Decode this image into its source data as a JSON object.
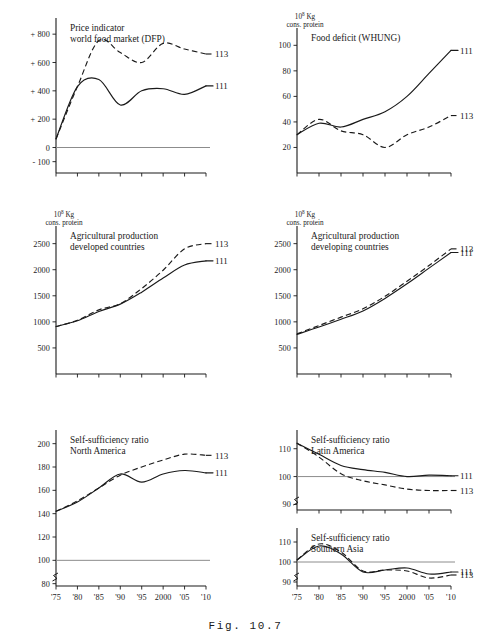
{
  "figure": {
    "caption": "Fig. 10.7"
  },
  "series_labels": {
    "a": "111",
    "b": "113"
  },
  "axis_units": {
    "base": "10",
    "exp": "8",
    "kg": " Kg",
    "protein": "cons. protein"
  },
  "charts": [
    {
      "id": "price-indicator",
      "title_line1": "Price indicator",
      "title_line2": "world food market (DFP)",
      "unit_line1": "",
      "unit_line2": "",
      "ylabel": "",
      "xlabel": "",
      "yticks": [
        "+ 800",
        "+ 600",
        "+ 400",
        "+ 200",
        "0",
        "- 100"
      ],
      "ytick_values": [
        800,
        600,
        400,
        200,
        0,
        -100
      ],
      "xticks": [],
      "xtick_values": [
        1975,
        1980,
        1985,
        1990,
        1995,
        2000,
        2005,
        2010
      ],
      "ylim": [
        -180,
        900
      ],
      "xlim": [
        1975,
        2010
      ],
      "zero_line": 0,
      "grid": false,
      "legend_position": "right-end-of-line",
      "type": "line",
      "x": [
        1975,
        1980,
        1985,
        1990,
        1995,
        2000,
        2005,
        2010
      ],
      "series": [
        {
          "name": "111",
          "style": "solid",
          "values": [
            60,
            430,
            480,
            300,
            400,
            415,
            375,
            435
          ]
        },
        {
          "name": "113",
          "style": "dashed",
          "values": [
            60,
            430,
            755,
            670,
            600,
            735,
            695,
            660
          ]
        }
      ]
    },
    {
      "id": "food-deficit",
      "title_line1": "Food deficit (WHUNG)",
      "title_line2": "",
      "unit_line1": "10⁸ Kg",
      "unit_line2": "cons. protein",
      "yticks": [
        "100",
        "80",
        "60",
        "40",
        "20"
      ],
      "ytick_values": [
        100,
        80,
        60,
        40,
        20
      ],
      "xticks": [],
      "xtick_values": [
        1975,
        1980,
        1985,
        1990,
        1995,
        2000,
        2005,
        2010
      ],
      "ylim": [
        0,
        112
      ],
      "xlim": [
        1975,
        2010
      ],
      "grid": false,
      "type": "line",
      "x": [
        1975,
        1980,
        1985,
        1990,
        1995,
        2000,
        2005,
        2010
      ],
      "series": [
        {
          "name": "111",
          "style": "solid",
          "values": [
            30,
            39,
            36,
            42,
            48,
            60,
            78,
            96
          ]
        },
        {
          "name": "113",
          "style": "dashed",
          "values": [
            30,
            42,
            33,
            30,
            20,
            30,
            36,
            45
          ]
        }
      ]
    },
    {
      "id": "agri-production-developed",
      "title_line1": "Agricultural production",
      "title_line2": "developed countries",
      "unit_line1": "10⁸ Kg",
      "unit_line2": "cons. protein",
      "yticks": [
        "2500",
        "2000",
        "1500",
        "1000",
        "500"
      ],
      "ytick_values": [
        2500,
        2000,
        1500,
        1000,
        500
      ],
      "xticks": [],
      "xtick_values": [
        1975,
        1980,
        1985,
        1990,
        1995,
        2000,
        2005,
        2010
      ],
      "ylim": [
        0,
        2800
      ],
      "xlim": [
        1975,
        2010
      ],
      "grid": false,
      "type": "line",
      "x": [
        1975,
        1980,
        1985,
        1990,
        1995,
        2000,
        2005,
        2010
      ],
      "series": [
        {
          "name": "111",
          "style": "solid",
          "values": [
            910,
            1020,
            1200,
            1340,
            1570,
            1840,
            2090,
            2170
          ]
        },
        {
          "name": "113",
          "style": "dashed",
          "values": [
            910,
            1030,
            1230,
            1350,
            1640,
            1990,
            2400,
            2500
          ]
        }
      ]
    },
    {
      "id": "agri-production-developing",
      "title_line1": "Agricultural production",
      "title_line2": "developing countries",
      "unit_line1": "10⁸ Kg",
      "unit_line2": "cons. protein",
      "yticks": [
        "2500",
        "2000",
        "1500",
        "1000",
        "500"
      ],
      "ytick_values": [
        2500,
        2000,
        1500,
        1000,
        500
      ],
      "xticks": [],
      "xtick_values": [
        1975,
        1980,
        1985,
        1990,
        1995,
        2000,
        2005,
        2010
      ],
      "ylim": [
        0,
        2800
      ],
      "xlim": [
        1975,
        2010
      ],
      "grid": false,
      "type": "line",
      "x": [
        1975,
        1980,
        1985,
        1990,
        1995,
        2000,
        2005,
        2010
      ],
      "series": [
        {
          "name": "111",
          "style": "solid",
          "values": [
            760,
            900,
            1050,
            1210,
            1450,
            1730,
            2030,
            2330
          ]
        },
        {
          "name": "113",
          "style": "dashed",
          "values": [
            770,
            930,
            1090,
            1250,
            1490,
            1780,
            2080,
            2400
          ]
        }
      ]
    },
    {
      "id": "ssr-north-america",
      "title_line1": "Self-sufficiency ratio",
      "title_line2": "North America",
      "unit_line1": "",
      "unit_line2": "",
      "yticks": [
        "200",
        "180",
        "160",
        "140",
        "120",
        "100",
        "80"
      ],
      "ytick_values": [
        200,
        180,
        160,
        140,
        120,
        100,
        80
      ],
      "xticks": [
        "'75",
        "'80",
        "'85",
        "'90",
        "'95",
        "2000",
        "'05",
        "'10"
      ],
      "xtick_values": [
        1975,
        1980,
        1985,
        1990,
        1995,
        2000,
        2005,
        2010
      ],
      "ylim": [
        78,
        210
      ],
      "xlim": [
        1975,
        2010
      ],
      "reference_line": 100,
      "axis_break": true,
      "grid": false,
      "type": "line",
      "x": [
        1975,
        1980,
        1985,
        1990,
        1995,
        2000,
        2005,
        2010
      ],
      "series": [
        {
          "name": "111",
          "style": "solid",
          "values": [
            142,
            150,
            162,
            174,
            167,
            174,
            177,
            175
          ]
        },
        {
          "name": "113",
          "style": "dashed",
          "values": [
            142,
            151,
            162,
            173,
            180,
            186,
            191,
            190
          ]
        }
      ]
    },
    {
      "id": "ssr-latin-america",
      "title_line1": "Self-sufficiency ratio",
      "title_line2": "Latin America",
      "unit_line1": "",
      "unit_line2": "",
      "yticks": [
        "110",
        "100",
        "90"
      ],
      "ytick_values": [
        110,
        100,
        90
      ],
      "xticks": [],
      "xtick_values": [
        1975,
        1980,
        1985,
        1990,
        1995,
        2000,
        2005,
        2010
      ],
      "ylim": [
        88,
        116
      ],
      "xlim": [
        1975,
        2010
      ],
      "reference_line": 100,
      "axis_break": true,
      "grid": false,
      "type": "line",
      "x": [
        1975,
        1980,
        1985,
        1990,
        1995,
        2000,
        2005,
        2010
      ],
      "series": [
        {
          "name": "111",
          "style": "solid",
          "values": [
            112,
            108,
            104,
            102.5,
            101.5,
            100,
            100.5,
            100.3
          ]
        },
        {
          "name": "113",
          "style": "dashed",
          "values": [
            112,
            107,
            101,
            98.5,
            97,
            95.5,
            95,
            95
          ]
        }
      ]
    },
    {
      "id": "ssr-southern-asia",
      "title_line1": "Self-sufficiency ratio",
      "title_line2": "Southern Asia",
      "unit_line1": "",
      "unit_line2": "",
      "yticks": [
        "110",
        "100",
        "90"
      ],
      "ytick_values": [
        110,
        100,
        90
      ],
      "xticks": [
        "'75",
        "'80",
        "'85",
        "'90",
        "'95",
        "2000",
        "'05",
        "'10"
      ],
      "xtick_values": [
        1975,
        1980,
        1985,
        1990,
        1995,
        2000,
        2005,
        2010
      ],
      "ylim": [
        88,
        116
      ],
      "xlim": [
        1975,
        2010
      ],
      "reference_line": 100,
      "axis_break": true,
      "grid": false,
      "type": "line",
      "x": [
        1975,
        1980,
        1985,
        1990,
        1995,
        2000,
        2005,
        2010
      ],
      "series": [
        {
          "name": "111",
          "style": "solid",
          "values": [
            101,
            108,
            104,
            95,
            96,
            97,
            94,
            95
          ]
        },
        {
          "name": "113",
          "style": "dashed",
          "values": [
            101,
            109,
            105,
            95.5,
            96,
            95.5,
            92,
            93.5
          ]
        }
      ]
    }
  ],
  "chart_data": {
    "type": "line",
    "xlabel": "Year",
    "x": [
      1975,
      1980,
      1985,
      1990,
      1995,
      2000,
      2005,
      2010
    ],
    "xtick_labels": [
      "'75",
      "'80",
      "'85",
      "'90",
      "'95",
      "2000",
      "'05",
      "'10"
    ],
    "legend": [
      "111",
      "113"
    ],
    "legend_position": "right, at end of each curve",
    "grid": false,
    "panels": [
      {
        "panel": "Price indicator world food market (DFP)",
        "ylabel": "",
        "ylim": [
          -180,
          900
        ],
        "ytick_labels": [
          "+ 800",
          "+ 600",
          "+ 400",
          "+ 200",
          "0",
          "- 100"
        ],
        "series": [
          {
            "name": "111",
            "values": [
              60,
              430,
              480,
              300,
              400,
              415,
              375,
              435
            ]
          },
          {
            "name": "113",
            "values": [
              60,
              430,
              755,
              670,
              600,
              735,
              695,
              660
            ]
          }
        ]
      },
      {
        "panel": "Food deficit (WHUNG)",
        "ylabel": "10^8 Kg cons. protein",
        "ylim": [
          0,
          112
        ],
        "ytick_labels": [
          "20",
          "40",
          "60",
          "80",
          "100"
        ],
        "series": [
          {
            "name": "111",
            "values": [
              30,
              39,
              36,
              42,
              48,
              60,
              78,
              96
            ]
          },
          {
            "name": "113",
            "values": [
              30,
              42,
              33,
              30,
              20,
              30,
              36,
              45
            ]
          }
        ]
      },
      {
        "panel": "Agricultural production developed countries",
        "ylabel": "10^8 Kg cons. protein",
        "ylim": [
          0,
          2800
        ],
        "ytick_labels": [
          "500",
          "1000",
          "1500",
          "2000",
          "2500"
        ],
        "series": [
          {
            "name": "111",
            "values": [
              910,
              1020,
              1200,
              1340,
              1570,
              1840,
              2090,
              2170
            ]
          },
          {
            "name": "113",
            "values": [
              910,
              1030,
              1230,
              1350,
              1640,
              1990,
              2400,
              2500
            ]
          }
        ]
      },
      {
        "panel": "Agricultural production developing countries",
        "ylabel": "10^8 Kg cons. protein",
        "ylim": [
          0,
          2800
        ],
        "ytick_labels": [
          "500",
          "1000",
          "1500",
          "2000",
          "2500"
        ],
        "series": [
          {
            "name": "111",
            "values": [
              760,
              900,
              1050,
              1210,
              1450,
              1730,
              2030,
              2330
            ]
          },
          {
            "name": "113",
            "values": [
              770,
              930,
              1090,
              1250,
              1490,
              1780,
              2080,
              2400
            ]
          }
        ]
      },
      {
        "panel": "Self-sufficiency ratio North America",
        "ylabel": "",
        "ylim": [
          78,
          210
        ],
        "ytick_labels": [
          "80",
          "100",
          "120",
          "140",
          "160",
          "180",
          "200"
        ],
        "reference_line": 100,
        "series": [
          {
            "name": "111",
            "values": [
              142,
              150,
              162,
              174,
              167,
              174,
              177,
              175
            ]
          },
          {
            "name": "113",
            "values": [
              142,
              151,
              162,
              173,
              180,
              186,
              191,
              190
            ]
          }
        ]
      },
      {
        "panel": "Self-sufficiency ratio Latin America",
        "ylabel": "",
        "ylim": [
          88,
          116
        ],
        "ytick_labels": [
          "90",
          "100",
          "110"
        ],
        "reference_line": 100,
        "series": [
          {
            "name": "111",
            "values": [
              112,
              108,
              104,
              102.5,
              101.5,
              100,
              100.5,
              100.3
            ]
          },
          {
            "name": "113",
            "values": [
              112,
              107,
              101,
              98.5,
              97,
              95.5,
              95,
              95
            ]
          }
        ]
      },
      {
        "panel": "Self-sufficiency ratio Southern Asia",
        "ylabel": "",
        "ylim": [
          88,
          116
        ],
        "ytick_labels": [
          "90",
          "100",
          "110"
        ],
        "reference_line": 100,
        "series": [
          {
            "name": "111",
            "values": [
              101,
              108,
              104,
              95,
              96,
              97,
              94,
              95
            ]
          },
          {
            "name": "113",
            "values": [
              101,
              109,
              105,
              95.5,
              96,
              95.5,
              92,
              93.5
            ]
          }
        ]
      }
    ]
  }
}
